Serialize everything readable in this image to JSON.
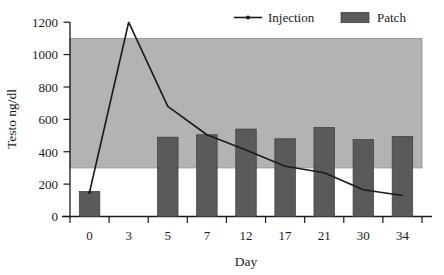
{
  "chart_data": {
    "type": "bar",
    "title": "",
    "subtitle": "",
    "xlabel": "Day",
    "ylabel": "Testo ng/dl",
    "categories": [
      "0",
      "3",
      "5",
      "7",
      "12",
      "17",
      "21",
      "30",
      "34"
    ],
    "xlim": [
      0,
      9
    ],
    "ylim": [
      0,
      1200
    ],
    "yticks": [
      0,
      200,
      400,
      600,
      800,
      1000,
      1200
    ],
    "ytick_labels": [
      "0",
      "200",
      "400",
      "600",
      "800",
      "1000",
      "1200"
    ],
    "grid": false,
    "legend_position": "top-right",
    "series": [
      {
        "name": "Injection",
        "type": "line",
        "marker": "dot",
        "color": "#1a1a1a",
        "values": [
          150,
          1200,
          680,
          505,
          410,
          310,
          270,
          165,
          130
        ]
      },
      {
        "name": "Patch",
        "type": "bar",
        "color": "#5a5a5a",
        "values": [
          155,
          null,
          490,
          505,
          540,
          480,
          550,
          475,
          495
        ]
      }
    ],
    "annotations": [
      {
        "name": "normal-range-band",
        "type": "hband",
        "y_from": 300,
        "y_to": 1100,
        "color": "#b3b3b3",
        "label": ""
      }
    ]
  },
  "legend": {
    "items": [
      {
        "label": "Injection",
        "marker": "line-dot",
        "color": "#1a1a1a"
      },
      {
        "label": "Patch",
        "marker": "filled-rect",
        "color": "#5a5a5a"
      }
    ]
  },
  "axes": {
    "y_title": "Testo ng/dl",
    "x_title": "Day",
    "y_tick_labels": [
      "1200",
      "1000",
      "800",
      "600",
      "400",
      "200",
      "0"
    ],
    "x_tick_labels": [
      "0",
      "3",
      "5",
      "7",
      "12",
      "17",
      "21",
      "30",
      "34"
    ]
  }
}
